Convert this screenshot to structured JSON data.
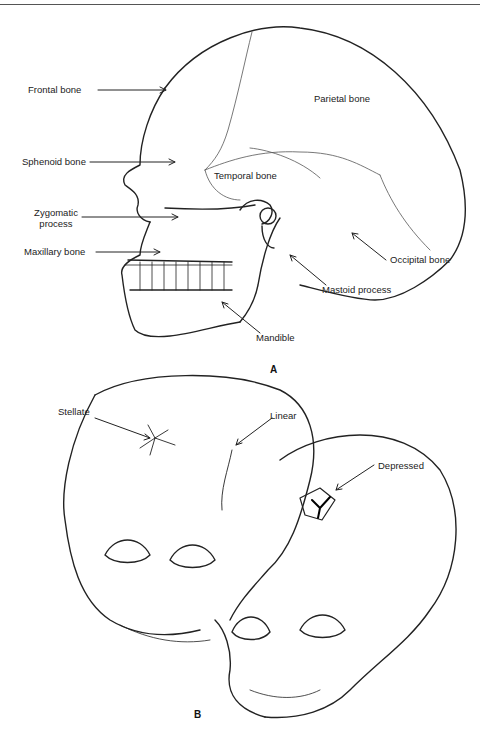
{
  "figure": {
    "panel_a": {
      "label": "A",
      "labels": {
        "frontal": "Frontal bone",
        "parietal": "Parietal bone",
        "sphenoid": "Sphenoid bone",
        "temporal": "Temporal bone",
        "zygomatic_line1": "Zygomatic",
        "zygomatic_line2": "process",
        "maxillary": "Maxillary bone",
        "occipital": "Occipital bone",
        "mastoid": "Mastoid process",
        "mandible": "Mandible"
      }
    },
    "panel_b": {
      "label": "B",
      "labels": {
        "stellate": "Stellate",
        "linear": "Linear",
        "depressed": "Depressed"
      }
    }
  }
}
